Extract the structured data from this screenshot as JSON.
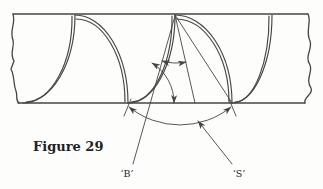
{
  "figure": {
    "caption": "Figure 29",
    "labels": {
      "b": "‘B’",
      "s": "‘S’"
    }
  },
  "colors": {
    "line": "#454545",
    "text": "#1f1f1f",
    "background": "#fdfdfc"
  }
}
